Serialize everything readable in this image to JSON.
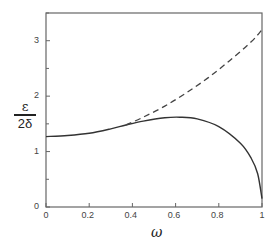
{
  "chart_data": {
    "type": "line",
    "title": "",
    "xlabel": "ω",
    "ylabel_numerator": "ε",
    "ylabel_denominator": "2δ",
    "xlim": [
      0,
      1
    ],
    "ylim": [
      0,
      3.5
    ],
    "x_ticks": [
      "0",
      "0.2",
      "0.4",
      "0.6",
      "0.8",
      "1"
    ],
    "y_ticks": [
      "0",
      "1",
      "2",
      "3"
    ],
    "grid": false,
    "legend": null,
    "series": [
      {
        "name": "solid",
        "style": "solid",
        "x": [
          0,
          0.1,
          0.2,
          0.3,
          0.37,
          0.45,
          0.55,
          0.62,
          0.7,
          0.8,
          0.9,
          0.95,
          0.98,
          1.0
        ],
        "y": [
          1.27,
          1.29,
          1.33,
          1.41,
          1.48,
          1.55,
          1.61,
          1.62,
          1.59,
          1.45,
          1.15,
          0.88,
          0.6,
          0.15
        ]
      },
      {
        "name": "dashed",
        "style": "dashed",
        "x": [
          0.37,
          0.45,
          0.55,
          0.65,
          0.75,
          0.85,
          0.95,
          1.0
        ],
        "y": [
          1.48,
          1.62,
          1.82,
          2.06,
          2.33,
          2.64,
          2.98,
          3.2
        ]
      }
    ]
  }
}
